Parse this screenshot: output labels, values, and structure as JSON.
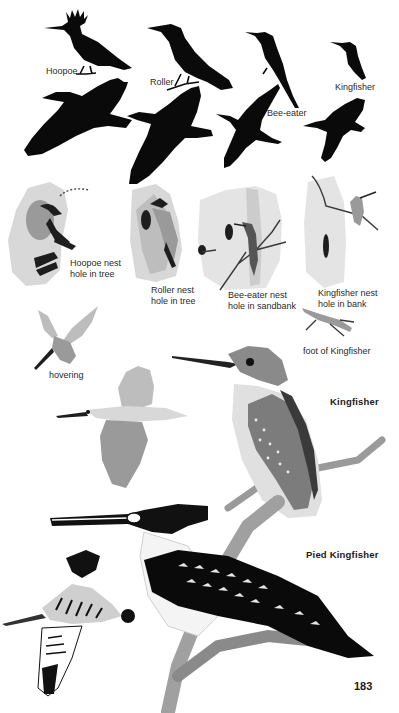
{
  "page": {
    "number": "183",
    "background": "#ffffff",
    "ink_color": "#0a0a0a"
  },
  "silhouettes": {
    "perched": [
      {
        "label": "Hoopoe"
      },
      {
        "label": "Roller"
      },
      {
        "label": "Bee-eater"
      },
      {
        "label": "Kingfisher"
      }
    ]
  },
  "nests": [
    {
      "line1": "Hoopoe nest",
      "line2": "hole in tree"
    },
    {
      "line1": "Roller nest",
      "line2": "hole in tree"
    },
    {
      "line1": "Bee-eater nest",
      "line2": "hole in sandbank"
    },
    {
      "line1": "Kingfisher nest",
      "line2": "hole in bank"
    }
  ],
  "details": {
    "foot_label": "foot of Kingfisher",
    "hovering_label": "hovering"
  },
  "species": [
    {
      "name": "Kingfisher"
    },
    {
      "name": "Pied Kingfisher"
    }
  ]
}
